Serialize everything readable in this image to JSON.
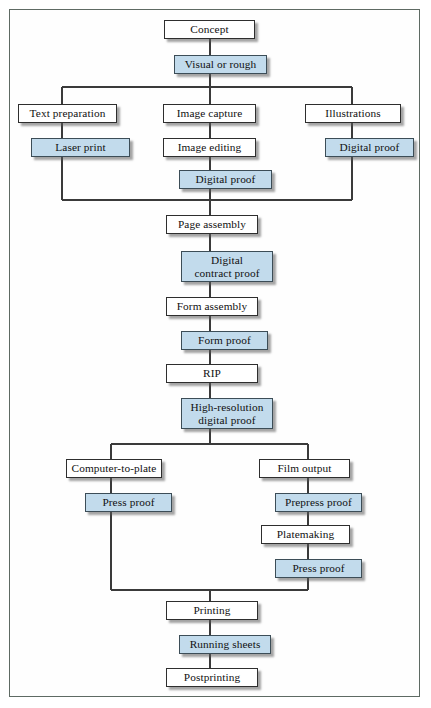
{
  "diagram": {
    "type": "flowchart",
    "colors": {
      "box_fill": "#ffffff",
      "highlight_fill": "#c2dbec",
      "border": "#2e2e2e",
      "frame": "#5e6a63",
      "connector": "#3a3a3a",
      "page_background": "#ffffff"
    },
    "legend_note": "Shaded (blue) boxes denote proofing / output stages",
    "nodes": [
      {
        "id": "concept",
        "label": "Concept",
        "highlight": false,
        "x": 164,
        "y": 20,
        "w": 91,
        "h": 19
      },
      {
        "id": "visual",
        "label": "Visual or rough",
        "highlight": true,
        "x": 174,
        "y": 55,
        "w": 93,
        "h": 19
      },
      {
        "id": "text-prep",
        "label": "Text preparation",
        "highlight": false,
        "x": 18,
        "y": 104,
        "w": 99,
        "h": 19
      },
      {
        "id": "image-capture",
        "label": "Image capture",
        "highlight": false,
        "x": 163,
        "y": 104,
        "w": 93,
        "h": 19
      },
      {
        "id": "illustrations",
        "label": "Illustrations",
        "highlight": false,
        "x": 305,
        "y": 104,
        "w": 96,
        "h": 19
      },
      {
        "id": "laser-print",
        "label": "Laser print",
        "highlight": true,
        "x": 31,
        "y": 138,
        "w": 99,
        "h": 19
      },
      {
        "id": "image-editing",
        "label": "Image editing",
        "highlight": false,
        "x": 163,
        "y": 138,
        "w": 93,
        "h": 19
      },
      {
        "id": "digital-proof-r",
        "label": "Digital proof",
        "highlight": true,
        "x": 325,
        "y": 138,
        "w": 89,
        "h": 19
      },
      {
        "id": "digital-proof-c",
        "label": "Digital proof",
        "highlight": true,
        "x": 179,
        "y": 170,
        "w": 93,
        "h": 19
      },
      {
        "id": "page-assembly",
        "label": "Page assembly",
        "highlight": false,
        "x": 166,
        "y": 215,
        "w": 92,
        "h": 19
      },
      {
        "id": "contract-proof",
        "label": "Digital\ncontract proof",
        "highlight": true,
        "x": 181,
        "y": 251,
        "w": 92,
        "h": 31
      },
      {
        "id": "form-assembly",
        "label": "Form assembly",
        "highlight": false,
        "x": 166,
        "y": 297,
        "w": 92,
        "h": 19
      },
      {
        "id": "form-proof",
        "label": "Form proof",
        "highlight": true,
        "x": 181,
        "y": 331,
        "w": 87,
        "h": 19
      },
      {
        "id": "rip",
        "label": "RIP",
        "highlight": false,
        "x": 166,
        "y": 364,
        "w": 92,
        "h": 19
      },
      {
        "id": "hires-proof",
        "label": "High-resolution\ndigital proof",
        "highlight": true,
        "x": 181,
        "y": 398,
        "w": 92,
        "h": 31
      },
      {
        "id": "ctp",
        "label": "Computer-to-plate",
        "highlight": false,
        "x": 66,
        "y": 459,
        "w": 96,
        "h": 19
      },
      {
        "id": "film-output",
        "label": "Film output",
        "highlight": false,
        "x": 259,
        "y": 459,
        "w": 91,
        "h": 19
      },
      {
        "id": "press-proof-l",
        "label": "Press proof",
        "highlight": true,
        "x": 85,
        "y": 493,
        "w": 87,
        "h": 19
      },
      {
        "id": "prepress-proof",
        "label": "Prepress proof",
        "highlight": true,
        "x": 275,
        "y": 493,
        "w": 87,
        "h": 19
      },
      {
        "id": "platemaking",
        "label": "Platemaking",
        "highlight": false,
        "x": 261,
        "y": 525,
        "w": 89,
        "h": 19
      },
      {
        "id": "press-proof-r",
        "label": "Press proof",
        "highlight": true,
        "x": 275,
        "y": 559,
        "w": 87,
        "h": 19
      },
      {
        "id": "printing",
        "label": "Printing",
        "highlight": false,
        "x": 166,
        "y": 601,
        "w": 92,
        "h": 19
      },
      {
        "id": "running-sheets",
        "label": "Running sheets",
        "highlight": true,
        "x": 179,
        "y": 635,
        "w": 92,
        "h": 19
      },
      {
        "id": "postprinting",
        "label": "Postprinting",
        "highlight": false,
        "x": 166,
        "y": 668,
        "w": 92,
        "h": 19
      }
    ],
    "edges": [
      {
        "from": "concept",
        "to": "visual",
        "kind": "straight"
      },
      {
        "from": "visual",
        "to": "text-prep",
        "kind": "branch"
      },
      {
        "from": "visual",
        "to": "image-capture",
        "kind": "straight"
      },
      {
        "from": "visual",
        "to": "illustrations",
        "kind": "branch"
      },
      {
        "from": "text-prep",
        "to": "laser-print",
        "kind": "straight"
      },
      {
        "from": "image-capture",
        "to": "image-editing",
        "kind": "straight"
      },
      {
        "from": "illustrations",
        "to": "digital-proof-r",
        "kind": "straight"
      },
      {
        "from": "image-editing",
        "to": "digital-proof-c",
        "kind": "straight"
      },
      {
        "from": "laser-print",
        "to": "page-assembly",
        "kind": "merge"
      },
      {
        "from": "digital-proof-c",
        "to": "page-assembly",
        "kind": "straight"
      },
      {
        "from": "digital-proof-r",
        "to": "page-assembly",
        "kind": "merge"
      },
      {
        "from": "page-assembly",
        "to": "contract-proof",
        "kind": "straight"
      },
      {
        "from": "contract-proof",
        "to": "form-assembly",
        "kind": "straight"
      },
      {
        "from": "form-assembly",
        "to": "form-proof",
        "kind": "straight"
      },
      {
        "from": "form-proof",
        "to": "rip",
        "kind": "straight"
      },
      {
        "from": "rip",
        "to": "hires-proof",
        "kind": "straight"
      },
      {
        "from": "hires-proof",
        "to": "ctp",
        "kind": "branch"
      },
      {
        "from": "hires-proof",
        "to": "film-output",
        "kind": "branch"
      },
      {
        "from": "ctp",
        "to": "press-proof-l",
        "kind": "straight"
      },
      {
        "from": "film-output",
        "to": "prepress-proof",
        "kind": "straight"
      },
      {
        "from": "prepress-proof",
        "to": "platemaking",
        "kind": "straight"
      },
      {
        "from": "platemaking",
        "to": "press-proof-r",
        "kind": "straight"
      },
      {
        "from": "press-proof-l",
        "to": "printing",
        "kind": "merge"
      },
      {
        "from": "press-proof-r",
        "to": "printing",
        "kind": "merge"
      },
      {
        "from": "printing",
        "to": "running-sheets",
        "kind": "straight"
      },
      {
        "from": "running-sheets",
        "to": "postprinting",
        "kind": "straight"
      }
    ]
  }
}
